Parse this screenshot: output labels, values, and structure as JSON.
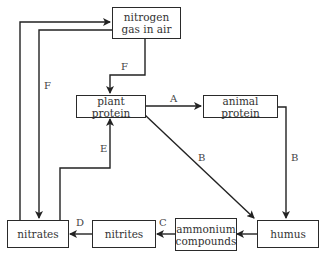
{
  "diagram": {
    "type": "nitrogen-cycle",
    "nodes": {
      "nitrogen_gas": "nitrogen gas in air",
      "nitrogen_gas_line1": "nitrogen",
      "nitrogen_gas_line2": "gas in air",
      "plant_protein": "plant protein",
      "animal_protein": "animal protein",
      "humus": "humus",
      "ammonium_line1": "ammonium",
      "ammonium_line2": "compounds",
      "nitrites": "nitrites",
      "nitrates": "nitrates"
    },
    "edge_labels": {
      "A": "A",
      "B1": "B",
      "B2": "B",
      "C": "C",
      "D": "D",
      "E": "E",
      "F1": "F",
      "F2": "F"
    },
    "edges": [
      {
        "from": "plant protein",
        "to": "animal protein",
        "label": "A"
      },
      {
        "from": "plant protein",
        "to": "humus",
        "label": "B"
      },
      {
        "from": "animal protein",
        "to": "humus",
        "label": "B"
      },
      {
        "from": "humus",
        "to": "ammonium compounds",
        "label": ""
      },
      {
        "from": "ammonium compounds",
        "to": "nitrites",
        "label": "C"
      },
      {
        "from": "nitrites",
        "to": "nitrates",
        "label": "D"
      },
      {
        "from": "nitrates",
        "to": "plant protein",
        "label": "E"
      },
      {
        "from": "nitrogen gas in air",
        "to": "plant protein",
        "label": "F"
      },
      {
        "from": "nitrogen gas in air",
        "to": "nitrates",
        "label": "F"
      },
      {
        "from": "nitrates",
        "to": "nitrogen gas in air",
        "label": ""
      }
    ]
  }
}
